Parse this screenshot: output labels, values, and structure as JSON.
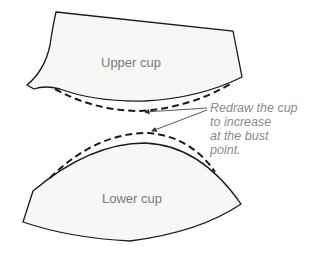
{
  "diagram": {
    "pieces": [
      {
        "name": "upper-cup",
        "label": "Upper cup"
      },
      {
        "name": "lower-cup",
        "label": "Lower cup"
      }
    ],
    "annotation": {
      "lines": [
        "Redraw the cup",
        "to increase",
        "at the bust",
        "point."
      ]
    },
    "colors": {
      "fill": "#f7f7f7",
      "stroke": "#1a1a1a",
      "label": "#7a7a7a",
      "annotation": "#8a8a8a"
    }
  }
}
